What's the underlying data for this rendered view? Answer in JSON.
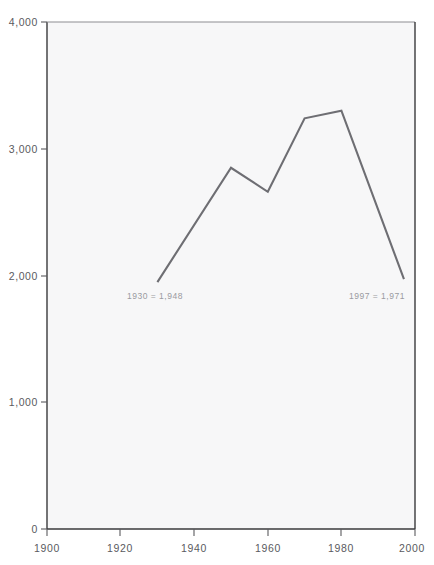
{
  "chart_data": {
    "type": "line",
    "title": "",
    "xlabel": "",
    "ylabel": "",
    "xlim": [
      1900,
      2000
    ],
    "ylim": [
      0,
      4000
    ],
    "grid": false,
    "legend": null,
    "x": [
      1930,
      1950,
      1960,
      1970,
      1980,
      1997
    ],
    "values": [
      1948,
      2850,
      2660,
      3240,
      3300,
      1971
    ],
    "series": [
      {
        "name": "series-1",
        "x": [
          1930,
          1950,
          1960,
          1970,
          1980,
          1997
        ],
        "values": [
          1948,
          2850,
          2660,
          3240,
          3300,
          1971
        ],
        "color": "#6e6e73"
      }
    ],
    "xticks": [
      1900,
      1920,
      1940,
      1960,
      1980,
      2000
    ],
    "xtick_labels": [
      "1900",
      "1920",
      "1940",
      "1960",
      "1980",
      "2000"
    ],
    "yticks": [
      0,
      1000,
      2000,
      3000,
      4000
    ],
    "ytick_labels": [
      "0",
      "1,000",
      "2,000",
      "3,000",
      "4,000"
    ],
    "annotations": [
      {
        "text": "1930 = 1,948",
        "x": 1930,
        "y": 1948
      },
      {
        "text": "1997 = 1,971",
        "x": 1997,
        "y": 1971
      }
    ]
  },
  "colors": {
    "line": "#6e6e73",
    "axis": "#3a3a3c",
    "plot_background": "#f7f7f8",
    "page_background": "#ffffff",
    "tick_text": "#5a5a5e",
    "annotation_text": "#9a9aa0"
  },
  "axes": {
    "y_labels": [
      "4,000",
      "3,000",
      "2,000",
      "1,000",
      "0"
    ],
    "x_labels": [
      "1900",
      "1920",
      "1940",
      "1960",
      "1980",
      "2000"
    ]
  },
  "annotations": {
    "left": "1930 = 1,948",
    "right": "1997 = 1,971"
  }
}
